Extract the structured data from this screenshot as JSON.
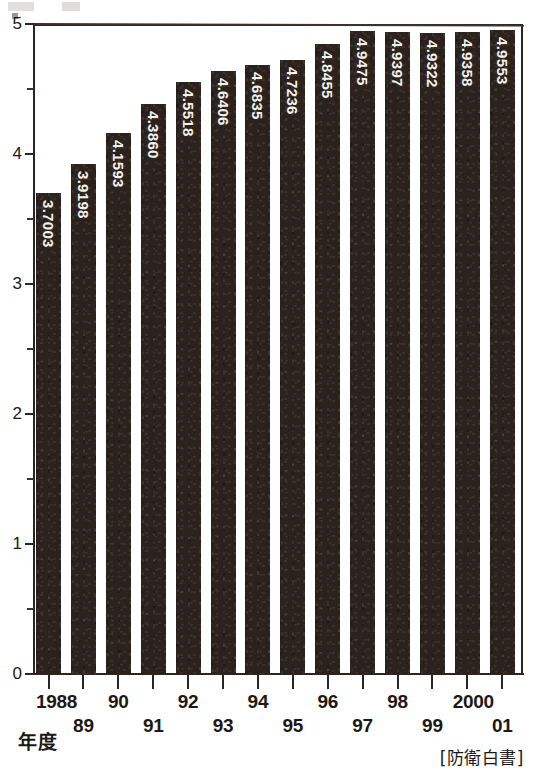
{
  "chart_data": {
    "type": "bar",
    "title": "",
    "subtitle": "",
    "xlabel": "年度",
    "ylabel": "",
    "ylim": [
      0,
      5
    ],
    "y_ticks": [
      "0",
      "1",
      "2",
      "3",
      "4",
      "5"
    ],
    "y_minor_step": 0.5,
    "grid": false,
    "legend": null,
    "orientation": "vertical",
    "bar_color": "#2b211d",
    "value_label_color": "#f5f2ec",
    "value_label_orientation": "vertical-bottom-to-top",
    "categories": [
      "1988",
      "89",
      "90",
      "91",
      "92",
      "93",
      "94",
      "95",
      "96",
      "97",
      "98",
      "99",
      "2000",
      "01"
    ],
    "values": [
      3.7003,
      3.9198,
      4.1593,
      4.386,
      4.5518,
      4.6406,
      4.6835,
      4.7236,
      4.8455,
      4.9475,
      4.9397,
      4.9322,
      4.9358,
      4.9553
    ],
    "value_labels": [
      "3.7003",
      "3.9198",
      "4.1593",
      "4.3860",
      "4.5518",
      "4.6406",
      "4.6835",
      "4.7236",
      "4.8455",
      "4.9475",
      "4.9397",
      "4.9322",
      "4.9358",
      "4.9553"
    ],
    "annotations": {
      "source": "[防衛白書]",
      "axis_caption": "年度"
    }
  },
  "axis": {
    "caption": "年度",
    "y_tick_labels": [
      "5",
      "4",
      "3",
      "2",
      "1",
      "0"
    ]
  },
  "footer": {
    "source": "[防衛白書]"
  }
}
